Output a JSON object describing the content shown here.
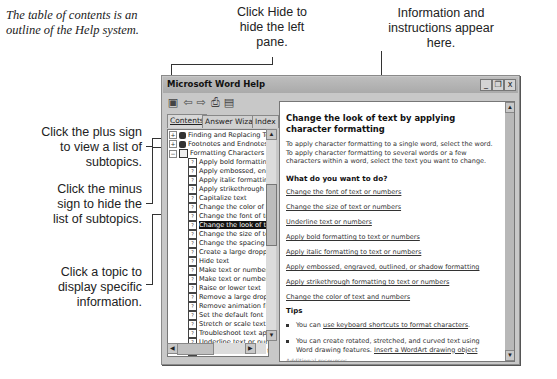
{
  "annotations": {
    "intro": "The table of contents is an outline of the Help system.",
    "hide_pane": "Click Hide to hide the left pane.",
    "info": "Information and instructions appear here.",
    "plus_sign": "Click the plus sign to view a list of subtopics.",
    "minus_sign": "Click the minus sign to hide the list of subtopics.",
    "topic": "Click a topic to display specific information."
  },
  "window": {
    "title": "Microsoft Word Help",
    "controls": {
      "minimize": "_",
      "restore": "❐",
      "close": "x"
    }
  },
  "toolbar": {
    "icons": [
      "hide-pane-icon",
      "back-icon",
      "forward-icon",
      "print-icon",
      "options-icon"
    ],
    "glyphs": [
      "▣",
      "⇦",
      "⇨",
      "⎙",
      "▤"
    ]
  },
  "tabs": [
    {
      "label": "Contents",
      "active": true
    },
    {
      "label": "Answer Wizard",
      "active": false
    },
    {
      "label": "Index",
      "active": false
    }
  ],
  "tree": [
    {
      "label": "Finding and Replacing Tex",
      "type": "book",
      "expander": "+",
      "level": 0
    },
    {
      "label": "Footnotes and Endnotes",
      "type": "book",
      "expander": "+",
      "level": 0
    },
    {
      "label": "Formatting Characters",
      "type": "openbook",
      "expander": "−",
      "level": 0
    },
    {
      "label": "Apply bold formatting to",
      "type": "page",
      "level": 1
    },
    {
      "label": "Apply embossed, engra",
      "type": "page",
      "level": 1
    },
    {
      "label": "Apply italic formatting t",
      "type": "page",
      "level": 1
    },
    {
      "label": "Apply strikethrough form",
      "type": "page",
      "level": 1
    },
    {
      "label": "Capitalize text",
      "type": "page",
      "level": 1
    },
    {
      "label": "Change the color of tex",
      "type": "page",
      "level": 1
    },
    {
      "label": "Change the font of text",
      "type": "page",
      "level": 1
    },
    {
      "label": "Change the look of text",
      "type": "page",
      "level": 1,
      "selected": true
    },
    {
      "label": "Change the size of text",
      "type": "page",
      "level": 1
    },
    {
      "label": "Change the spacing bet",
      "type": "page",
      "level": 1
    },
    {
      "label": "Create a large dropped",
      "type": "page",
      "level": 1
    },
    {
      "label": "Hide text",
      "type": "page",
      "level": 1
    },
    {
      "label": "Make text or numbers s",
      "type": "page",
      "level": 1
    },
    {
      "label": "Make text or numbers s",
      "type": "page",
      "level": 1
    },
    {
      "label": "Raise or lower text",
      "type": "page",
      "level": 1
    },
    {
      "label": "Remove a large droppe",
      "type": "page",
      "level": 1
    },
    {
      "label": "Remove animation from",
      "type": "page",
      "level": 1
    },
    {
      "label": "Set the default font",
      "type": "page",
      "level": 1
    },
    {
      "label": "Stretch or scale text ho",
      "type": "page",
      "level": 1
    },
    {
      "label": "Troubleshoot text appe",
      "type": "page",
      "level": 1
    },
    {
      "label": "Underline text or numbe",
      "type": "page",
      "level": 1
    },
    {
      "label": "Work with animated tex",
      "type": "page",
      "level": 1
    },
    {
      "label": "Formatting Paragraphs",
      "type": "book",
      "expander": "+",
      "level": 0
    }
  ],
  "content": {
    "heading": "Change the look of text by applying character formatting",
    "intro": "To apply character formatting to a single word, select the word. To apply character formatting to several words or a few characters within a word, select the text you want to change.",
    "subheading": "What do you want to do?",
    "links": [
      "Change the font of text or numbers",
      "Change the size of text or numbers",
      "Underline text or numbers",
      "Apply bold formatting to text or numbers",
      "Apply italic formatting to text or numbers",
      "Apply embossed, engraved, outlined, or shadow formatting",
      "Apply strikethrough formatting to text or numbers",
      "Change the color of text and numbers"
    ],
    "tips_label": "Tips",
    "tips": [
      {
        "prefix": "You can ",
        "link": "use keyboard shortcuts to format characters",
        "suffix": "."
      },
      {
        "prefix": "You can create rotated, stretched, and curved text using Word drawing features. ",
        "link": "Insert a WordArt drawing object",
        "suffix": ""
      }
    ],
    "additional": "Additional resources"
  }
}
